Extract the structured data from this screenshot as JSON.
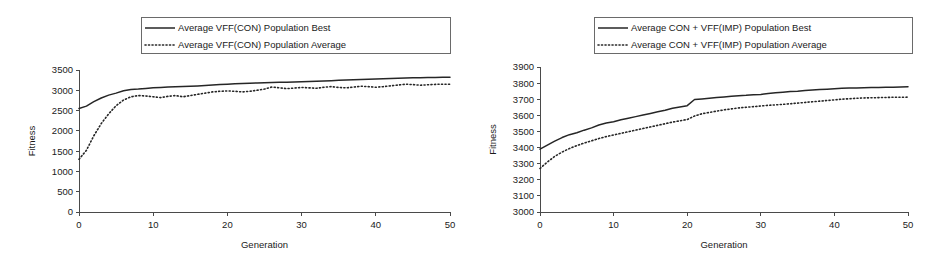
{
  "figure": {
    "background": "#ffffff",
    "ink": "#262626",
    "panel_count": 2
  },
  "chart_data": [
    {
      "type": "line",
      "panel": "left",
      "title": "",
      "xlabel": "Generation",
      "ylabel": "Fitness",
      "xlim": [
        0,
        50
      ],
      "ylim": [
        0,
        3500
      ],
      "xticks": [
        0,
        10,
        20,
        30,
        40,
        50
      ],
      "yticks": [
        0,
        500,
        1000,
        1500,
        2000,
        2500,
        3000,
        3500
      ],
      "grid": false,
      "legend_position": "above-plot",
      "x": [
        0,
        1,
        2,
        3,
        4,
        5,
        6,
        7,
        8,
        9,
        10,
        11,
        12,
        13,
        14,
        15,
        16,
        17,
        18,
        19,
        20,
        21,
        22,
        23,
        24,
        25,
        26,
        27,
        28,
        29,
        30,
        31,
        32,
        33,
        34,
        35,
        36,
        37,
        38,
        39,
        40,
        41,
        42,
        43,
        44,
        45,
        46,
        47,
        48,
        49,
        50
      ],
      "series": [
        {
          "name": "Average VFF(CON) Population Best",
          "style": "solid",
          "values": [
            2550,
            2610,
            2720,
            2810,
            2880,
            2930,
            2990,
            3020,
            3030,
            3045,
            3060,
            3070,
            3080,
            3085,
            3092,
            3100,
            3108,
            3118,
            3130,
            3140,
            3150,
            3160,
            3168,
            3175,
            3182,
            3188,
            3192,
            3196,
            3200,
            3205,
            3212,
            3218,
            3224,
            3230,
            3238,
            3245,
            3252,
            3258,
            3264,
            3270,
            3276,
            3282,
            3290,
            3296,
            3302,
            3306,
            3310,
            3314,
            3318,
            3320,
            3322
          ]
        },
        {
          "name": "Average VFF(CON) Population Average",
          "style": "dotted",
          "values": [
            1300,
            1520,
            1880,
            2180,
            2420,
            2620,
            2760,
            2840,
            2870,
            2860,
            2840,
            2820,
            2850,
            2870,
            2840,
            2870,
            2900,
            2930,
            2960,
            2975,
            2985,
            2975,
            2960,
            2975,
            3000,
            3030,
            3080,
            3060,
            3040,
            3055,
            3070,
            3060,
            3050,
            3075,
            3090,
            3070,
            3060,
            3080,
            3100,
            3090,
            3075,
            3090,
            3110,
            3130,
            3150,
            3140,
            3125,
            3135,
            3145,
            3150,
            3150
          ]
        }
      ]
    },
    {
      "type": "line",
      "panel": "right",
      "title": "",
      "xlabel": "Generation",
      "ylabel": "Fitness",
      "xlim": [
        0,
        50
      ],
      "ylim": [
        3000,
        3900
      ],
      "xticks": [
        0,
        10,
        20,
        30,
        40,
        50
      ],
      "yticks": [
        3000,
        3100,
        3200,
        3300,
        3400,
        3500,
        3600,
        3700,
        3800,
        3900
      ],
      "grid": false,
      "legend_position": "above-plot",
      "x": [
        0,
        1,
        2,
        3,
        4,
        5,
        6,
        7,
        8,
        9,
        10,
        11,
        12,
        13,
        14,
        15,
        16,
        17,
        18,
        19,
        20,
        21,
        22,
        23,
        24,
        25,
        26,
        27,
        28,
        29,
        30,
        31,
        32,
        33,
        34,
        35,
        36,
        37,
        38,
        39,
        40,
        41,
        42,
        43,
        44,
        45,
        46,
        47,
        48,
        49,
        50
      ],
      "series": [
        {
          "name": "Average CON + VFF(IMP) Population Best",
          "style": "solid",
          "values": [
            3390,
            3415,
            3440,
            3462,
            3480,
            3492,
            3508,
            3522,
            3540,
            3552,
            3560,
            3572,
            3582,
            3592,
            3602,
            3612,
            3622,
            3632,
            3644,
            3652,
            3660,
            3698,
            3702,
            3706,
            3710,
            3714,
            3718,
            3722,
            3724,
            3727,
            3730,
            3736,
            3740,
            3744,
            3748,
            3750,
            3754,
            3757,
            3760,
            3762,
            3765,
            3768,
            3769,
            3770,
            3771,
            3772,
            3773,
            3774,
            3775,
            3776,
            3777
          ]
        },
        {
          "name": "Average CON + VFF(IMP) Population Average",
          "style": "dotted",
          "values": [
            3270,
            3310,
            3345,
            3372,
            3394,
            3412,
            3428,
            3442,
            3456,
            3468,
            3478,
            3488,
            3498,
            3508,
            3518,
            3528,
            3538,
            3548,
            3558,
            3566,
            3574,
            3596,
            3610,
            3618,
            3626,
            3634,
            3640,
            3646,
            3650,
            3654,
            3658,
            3662,
            3665,
            3668,
            3672,
            3676,
            3680,
            3684,
            3688,
            3692,
            3696,
            3700,
            3703,
            3706,
            3708,
            3709,
            3710,
            3711,
            3712,
            3712,
            3713
          ]
        }
      ]
    }
  ]
}
